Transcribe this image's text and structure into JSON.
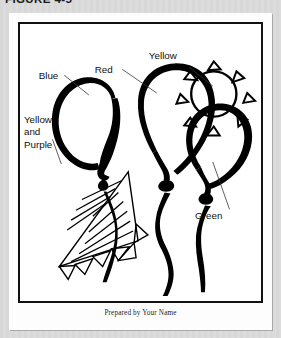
{
  "header": {
    "figure_number": "FIGURE 4-5"
  },
  "figure": {
    "caption": "Prepared by Your Name",
    "artwork_name": "balloon-cluster-line-art"
  },
  "callouts": [
    {
      "id": "yellow",
      "lines": [
        "Yellow"
      ],
      "x": 152,
      "y": 46
    },
    {
      "id": "red",
      "lines": [
        "Red"
      ],
      "x": 97,
      "y": 60
    },
    {
      "id": "blue",
      "lines": [
        "Blue"
      ],
      "x": 40,
      "y": 74
    },
    {
      "id": "yellow-and-purple",
      "lines": [
        "Yellow",
        "and",
        "Purple"
      ],
      "x": 28,
      "y": 118
    },
    {
      "id": "green",
      "lines": [
        "Green"
      ],
      "x": 213,
      "y": 218
    }
  ],
  "colors": {
    "ink": "#000000",
    "frame": "#111111",
    "sheet": "#fdfdfd",
    "backdrop": "#d8d8d8"
  }
}
